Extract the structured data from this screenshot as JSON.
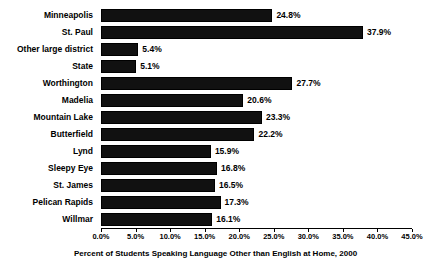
{
  "chart_data": {
    "type": "bar",
    "orientation": "horizontal",
    "title": "",
    "xlabel": "Percent of Students Speaking Language Other than English at Home, 2000",
    "ylabel": "",
    "xlim": [
      0,
      45
    ],
    "grid": false,
    "legend": null,
    "bar_color": "#111111",
    "categories": [
      "Minneapolis",
      "St. Paul",
      "Other large district",
      "State",
      "Worthington",
      "Madelia",
      "Mountain Lake",
      "Butterfield",
      "Lynd",
      "Sleepy Eye",
      "St. James",
      "Pelican Rapids",
      "Willmar"
    ],
    "values": [
      24.8,
      37.9,
      5.4,
      5.1,
      27.7,
      20.6,
      23.3,
      22.2,
      15.9,
      16.8,
      16.5,
      17.3,
      16.1
    ],
    "data_labels": [
      "24.8%",
      "37.9%",
      "5.4%",
      "5.1%",
      "27.7%",
      "20.6%",
      "23.3%",
      "22.2%",
      "15.9%",
      "16.8%",
      "16.5%",
      "17.3%",
      "16.1%"
    ],
    "xticks": [
      0,
      5,
      10,
      15,
      20,
      25,
      30,
      35,
      40,
      45
    ],
    "xticklabels": [
      "0.0%",
      "5.0%",
      "10.0%",
      "15.0%",
      "20.0%",
      "25.0%",
      "30.0%",
      "35.0%",
      "40.0%",
      "45.0%"
    ]
  }
}
